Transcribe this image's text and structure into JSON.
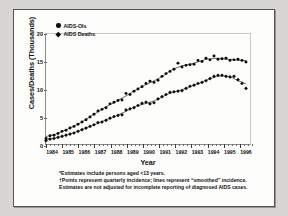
{
  "chart_data": {
    "type": "scatter",
    "title": "",
    "xlabel": "Year",
    "ylabel": "Cases/Deaths (Thousands)",
    "xlim": [
      1984.0,
      1996.75
    ],
    "ylim": [
      0,
      20
    ],
    "yticks": [
      0,
      5,
      10,
      15,
      20
    ],
    "xticks": [
      1984,
      1985,
      1986,
      1987,
      1988,
      1989,
      1990,
      1991,
      1992,
      1993,
      1994,
      1995,
      1996
    ],
    "grid": false,
    "legend_position": "top-left",
    "x": [
      1984.0,
      1984.25,
      1984.5,
      1984.75,
      1985.0,
      1985.25,
      1985.5,
      1985.75,
      1986.0,
      1986.25,
      1986.5,
      1986.75,
      1987.0,
      1987.25,
      1987.5,
      1987.75,
      1988.0,
      1988.25,
      1988.5,
      1988.75,
      1989.0,
      1989.25,
      1989.5,
      1989.75,
      1990.0,
      1990.25,
      1990.5,
      1990.75,
      1991.0,
      1991.25,
      1991.5,
      1991.75,
      1992.0,
      1992.25,
      1992.5,
      1992.75,
      1993.0,
      1993.25,
      1993.5,
      1993.75,
      1994.0,
      1994.25,
      1994.5,
      1994.75,
      1995.0,
      1995.25,
      1995.5,
      1995.75,
      1996.0,
      1996.25,
      1996.5
    ],
    "series": [
      {
        "name": "AIDS-OIs",
        "marker": "circle",
        "color": "#0d0d0d",
        "values": [
          1.0,
          1.5,
          1.6,
          1.9,
          2.3,
          2.5,
          2.9,
          3.2,
          3.6,
          4.0,
          4.4,
          4.9,
          5.4,
          6.0,
          6.3,
          6.6,
          7.3,
          7.6,
          7.9,
          8.0,
          9.2,
          9.0,
          9.6,
          10.0,
          10.4,
          11.0,
          11.4,
          11.2,
          11.6,
          12.3,
          12.8,
          13.2,
          13.6,
          14.7,
          14.0,
          14.3,
          14.4,
          14.5,
          15.2,
          15.0,
          15.6,
          15.3,
          16.0,
          15.4,
          15.5,
          15.6,
          15.2,
          15.3,
          15.4,
          15.2,
          14.9
        ]
      },
      {
        "name": "AIDS Deaths",
        "marker": "diamond",
        "color": "#0d0d0d",
        "values": [
          0.6,
          0.9,
          1.0,
          1.2,
          1.4,
          1.6,
          1.8,
          2.0,
          2.3,
          2.6,
          2.9,
          3.2,
          3.5,
          3.9,
          4.0,
          4.3,
          4.7,
          5.0,
          5.2,
          5.3,
          6.2,
          6.4,
          6.6,
          7.0,
          7.4,
          7.6,
          7.3,
          7.5,
          8.2,
          8.6,
          9.0,
          9.4,
          9.5,
          9.6,
          9.7,
          10.1,
          10.5,
          10.7,
          11.0,
          11.2,
          11.5,
          11.9,
          12.3,
          12.5,
          12.5,
          12.3,
          12.2,
          12.3,
          11.7,
          11.0,
          10.1
        ]
      }
    ]
  },
  "legend": {
    "items": [
      {
        "label": "AIDS-OIs",
        "marker": "circle"
      },
      {
        "label": "AIDS Deaths",
        "marker": "diamond"
      }
    ]
  },
  "axes": {
    "x_title": "Year",
    "y_title": "Cases/Deaths (Thousands)"
  },
  "footnotes": {
    "line1": "*Estimates include persons aged <13 years.",
    "line2": "†Points represent quarterly incidence; lines represent “smoothed” incidence.",
    "line3": "Estimates are not adjusted for incomplete reporting of diagnosed AIDS cases."
  }
}
